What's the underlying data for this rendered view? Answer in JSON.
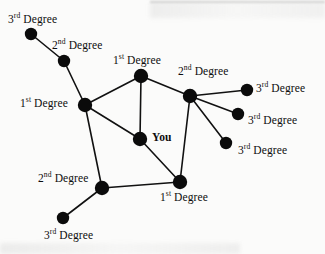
{
  "figure": {
    "background_color": "#fbfbfa",
    "node_color": "#0b0b0b",
    "edge_color": "#111111",
    "label_color": "#0d0d0d"
  },
  "nodes": [
    {
      "id": "n3a",
      "label_prefix": "3",
      "label_sup": "rd",
      "label_suffix": " Degree",
      "degree": "3rd",
      "x": 31,
      "y": 34,
      "r": 6.2,
      "label_x": 8,
      "label_y": 14,
      "label_anchor": "above-left"
    },
    {
      "id": "n2a",
      "label_prefix": "2",
      "label_sup": "nd",
      "label_suffix": " Degree",
      "degree": "2nd",
      "x": 64,
      "y": 61,
      "r": 6.2,
      "label_x": 52,
      "label_y": 40,
      "label_anchor": "above-right"
    },
    {
      "id": "n1L",
      "label_prefix": "1",
      "label_sup": "st",
      "label_suffix": " Degree",
      "degree": "1st",
      "x": 85,
      "y": 105,
      "r": 7.2,
      "label_x": 20,
      "label_y": 98,
      "label_anchor": "left"
    },
    {
      "id": "n1T",
      "label_prefix": "1",
      "label_sup": "st",
      "label_suffix": " Degree",
      "degree": "1st",
      "x": 141,
      "y": 76,
      "r": 7.2,
      "label_x": 113,
      "label_y": 55,
      "label_anchor": "above"
    },
    {
      "id": "you",
      "label_prefix": "You",
      "label_sup": "",
      "label_suffix": "",
      "degree": "self",
      "x": 140,
      "y": 139,
      "r": 7.2,
      "label_x": 152,
      "label_y": 132,
      "label_anchor": "right"
    },
    {
      "id": "n2R",
      "label_prefix": "2",
      "label_sup": "nd",
      "label_suffix": " Degree",
      "degree": "2nd",
      "x": 190,
      "y": 96,
      "r": 7.2,
      "label_x": 178,
      "label_y": 66,
      "label_anchor": "above"
    },
    {
      "id": "n3r1",
      "label_prefix": "3",
      "label_sup": "rd",
      "label_suffix": " Degree",
      "degree": "3rd",
      "x": 247,
      "y": 90,
      "r": 6.2,
      "label_x": 256,
      "label_y": 83,
      "label_anchor": "right"
    },
    {
      "id": "n3r2",
      "label_prefix": "3",
      "label_sup": "rd",
      "label_suffix": " Degree",
      "degree": "3rd",
      "x": 238,
      "y": 114,
      "r": 6.2,
      "label_x": 248,
      "label_y": 115,
      "label_anchor": "right"
    },
    {
      "id": "n3r3",
      "label_prefix": "3",
      "label_sup": "rd",
      "label_suffix": " Degree",
      "degree": "3rd",
      "x": 226,
      "y": 143,
      "r": 6.2,
      "label_x": 238,
      "label_y": 145,
      "label_anchor": "right"
    },
    {
      "id": "n1B",
      "label_prefix": "1",
      "label_sup": "st",
      "label_suffix": " Degree",
      "degree": "1st",
      "x": 180,
      "y": 182,
      "r": 7.2,
      "label_x": 160,
      "label_y": 192,
      "label_anchor": "below"
    },
    {
      "id": "n2B",
      "label_prefix": "2",
      "label_sup": "nd",
      "label_suffix": " Degree",
      "degree": "2nd",
      "x": 102,
      "y": 188,
      "r": 7.2,
      "label_x": 38,
      "label_y": 173,
      "label_anchor": "above-left"
    },
    {
      "id": "n3b",
      "label_prefix": "3",
      "label_sup": "rd",
      "label_suffix": " Degree",
      "degree": "3rd",
      "x": 63,
      "y": 218,
      "r": 6.2,
      "label_x": 44,
      "label_y": 230,
      "label_anchor": "below-left"
    }
  ],
  "edges": [
    {
      "from": "n3a",
      "to": "n2a",
      "width": 1.6
    },
    {
      "from": "n2a",
      "to": "n1L",
      "width": 1.6
    },
    {
      "from": "n1L",
      "to": "n1T",
      "width": 1.6
    },
    {
      "from": "n1L",
      "to": "you",
      "width": 1.6
    },
    {
      "from": "n1L",
      "to": "n2B",
      "width": 1.6
    },
    {
      "from": "n1T",
      "to": "you",
      "width": 1.6
    },
    {
      "from": "n1T",
      "to": "n2R",
      "width": 1.6
    },
    {
      "from": "n2R",
      "to": "n3r1",
      "width": 1.6
    },
    {
      "from": "n2R",
      "to": "n3r2",
      "width": 1.6
    },
    {
      "from": "n2R",
      "to": "n3r3",
      "width": 1.6
    },
    {
      "from": "n2R",
      "to": "n1B",
      "width": 1.6
    },
    {
      "from": "you",
      "to": "n1B",
      "width": 1.6
    },
    {
      "from": "n1B",
      "to": "n2B",
      "width": 1.6
    },
    {
      "from": "n2B",
      "to": "n3b",
      "width": 1.6
    }
  ]
}
